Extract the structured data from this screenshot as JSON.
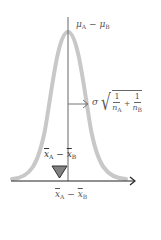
{
  "diagram": {
    "type": "normal-distribution-sampling",
    "curve_color": "#c8c8c8",
    "axis_color": "#222222",
    "center_line_color": "#666666",
    "marker_color": "#777777",
    "labels": {
      "mean_label": {
        "symbol": "μ",
        "sub_a": "A",
        "op": "−",
        "symbol2": "μ",
        "sub_b": "B"
      },
      "sd_label": {
        "sigma": "σ",
        "num1": "1",
        "den1_sym": "n",
        "den1_sub": "A",
        "plus": "+",
        "num2": "1",
        "den2_sym": "n",
        "den2_sub": "B"
      },
      "sample_label_upper": {
        "symbol": "x",
        "sub_a": "A",
        "op": "−",
        "symbol2": "x",
        "sub_b": "B"
      },
      "sample_label_axis": {
        "symbol": "x",
        "sub_a": "A",
        "op": "−",
        "symbol2": "x",
        "sub_b": "B"
      }
    }
  }
}
